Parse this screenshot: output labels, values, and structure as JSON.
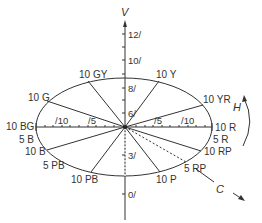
{
  "diagram": {
    "axes": {
      "value_label": "V",
      "hue_label": "H",
      "chroma_label": "C"
    },
    "value_ticks": [
      {
        "label": "12/",
        "y": 34
      },
      {
        "label": "10/",
        "y": 60
      },
      {
        "label": "8/",
        "y": 88
      },
      {
        "label": "6/",
        "y": 113
      },
      {
        "label": "3/",
        "y": 155
      },
      {
        "label": "0/",
        "y": 194
      }
    ],
    "chroma_ticks": {
      "left": [
        "/10",
        "/5"
      ],
      "right": [
        "/5",
        "/10"
      ]
    },
    "hues": [
      {
        "label": "10 GY",
        "id": "10gy"
      },
      {
        "label": "10 Y",
        "id": "10y"
      },
      {
        "label": "10 G",
        "id": "10g"
      },
      {
        "label": "10 YR",
        "id": "10yr"
      },
      {
        "label": "10 BG",
        "id": "10bg"
      },
      {
        "label": "10 R",
        "id": "10r"
      },
      {
        "label": "5 B",
        "id": "5b"
      },
      {
        "label": "5 R",
        "id": "5r"
      },
      {
        "label": "10 B",
        "id": "10b"
      },
      {
        "label": "10 RP",
        "id": "10rp"
      },
      {
        "label": "5 PB",
        "id": "5pb"
      },
      {
        "label": "5 RP",
        "id": "5rp"
      },
      {
        "label": "10 PB",
        "id": "10pb"
      },
      {
        "label": "10 P",
        "id": "10p"
      }
    ],
    "colors": {
      "line": "#333333",
      "background": "#ffffff"
    }
  }
}
